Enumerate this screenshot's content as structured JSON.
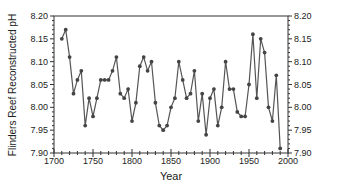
{
  "chart_data": {
    "type": "line",
    "title": "",
    "xlabel": "Year",
    "ylabel": "Flinders Reef Reconstructed pH",
    "xlim": [
      1700,
      2000
    ],
    "ylim": [
      7.9,
      8.2
    ],
    "x_ticks": [
      "1700",
      "1750",
      "1800",
      "1850",
      "1900",
      "1950",
      "2000"
    ],
    "y_ticks": [
      "7.90",
      "7.95",
      "8.00",
      "8.05",
      "8.10",
      "8.15",
      "8.20"
    ],
    "y_ticks_right": [
      "7.90",
      "7.95",
      "8.00",
      "8.05",
      "8.10",
      "8.15",
      "8.20"
    ],
    "grid": false,
    "legend": null,
    "series": [
      {
        "name": "Reconstructed pH",
        "color": "#555555",
        "marker": "circle",
        "x": [
          1710,
          1715,
          1720,
          1725,
          1730,
          1735,
          1740,
          1745,
          1750,
          1755,
          1760,
          1765,
          1770,
          1775,
          1780,
          1785,
          1790,
          1795,
          1800,
          1805,
          1810,
          1815,
          1820,
          1825,
          1830,
          1835,
          1840,
          1845,
          1850,
          1855,
          1860,
          1865,
          1870,
          1875,
          1880,
          1885,
          1890,
          1895,
          1900,
          1905,
          1910,
          1915,
          1920,
          1925,
          1930,
          1935,
          1940,
          1945,
          1950,
          1955,
          1960,
          1965,
          1970,
          1975,
          1980,
          1985,
          1990
        ],
        "values": [
          8.15,
          8.17,
          8.11,
          8.03,
          8.06,
          8.08,
          7.96,
          8.02,
          7.98,
          8.02,
          8.06,
          8.06,
          8.06,
          8.08,
          8.11,
          8.03,
          8.02,
          8.04,
          7.97,
          8.01,
          8.09,
          8.11,
          8.08,
          8.1,
          8.01,
          7.96,
          7.95,
          7.96,
          8.0,
          8.02,
          8.1,
          8.06,
          8.02,
          8.03,
          8.08,
          7.97,
          8.03,
          7.94,
          8.02,
          8.04,
          7.96,
          8.0,
          8.1,
          8.04,
          8.04,
          7.99,
          7.98,
          7.98,
          8.05,
          8.16,
          8.02,
          8.15,
          8.12,
          8.0,
          7.97,
          8.07,
          7.91
        ]
      }
    ]
  }
}
